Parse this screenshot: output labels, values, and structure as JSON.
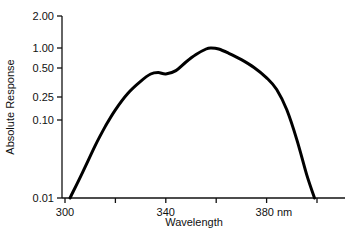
{
  "chart_data": {
    "type": "line",
    "title": "",
    "xlabel": "Wavelength",
    "ylabel": "Absolute Response",
    "x_unit": "nm",
    "xlim": [
      300,
      410
    ],
    "ylim": [
      0.01,
      2.0
    ],
    "yscale": "log",
    "grid": false,
    "legend": null,
    "x_ticks": [
      {
        "value": 300,
        "label": "300"
      },
      {
        "value": 320,
        "label": ""
      },
      {
        "value": 340,
        "label": "340"
      },
      {
        "value": 360,
        "label": ""
      },
      {
        "value": 380,
        "label": "380 nm"
      },
      {
        "value": 400,
        "label": ""
      }
    ],
    "y_ticks": [
      {
        "value": 2.0,
        "label": "2.00"
      },
      {
        "value": 1.0,
        "label": "1.00"
      },
      {
        "value": 0.5,
        "label": "0.50"
      },
      {
        "value": 0.25,
        "label": "0.25"
      },
      {
        "value": 0.1,
        "label": "0.10"
      },
      {
        "value": 0.01,
        "label": "0.01"
      }
    ],
    "series": [
      {
        "name": "Absolute Response",
        "x": [
          302,
          307,
          312,
          316,
          320,
          325,
          330,
          334,
          337,
          340,
          344,
          348,
          352,
          356,
          358,
          361,
          365,
          370,
          375,
          380,
          384,
          388,
          392,
          396,
          399
        ],
        "y": [
          0.01,
          0.022,
          0.05,
          0.09,
          0.15,
          0.25,
          0.36,
          0.45,
          0.47,
          0.45,
          0.5,
          0.65,
          0.82,
          0.97,
          1.0,
          0.97,
          0.85,
          0.7,
          0.55,
          0.4,
          0.28,
          0.15,
          0.06,
          0.02,
          0.01
        ]
      }
    ]
  }
}
